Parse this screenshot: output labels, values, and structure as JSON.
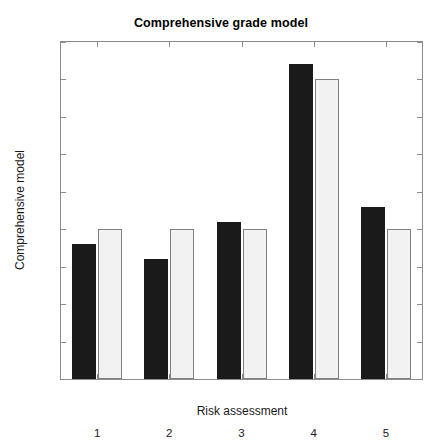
{
  "chart_data": {
    "type": "bar",
    "title": "Comprehensive grade model",
    "xlabel": "Risk assessment",
    "ylabel": "Comprehensive model",
    "categories": [
      "1",
      "2",
      "3",
      "4",
      "5"
    ],
    "series": [
      {
        "name": "series-dark",
        "color": "#1a1a1a",
        "values": [
          1.8,
          1.6,
          2.1,
          4.2,
          2.3
        ]
      },
      {
        "name": "series-light",
        "color": "#f2f2f2",
        "values": [
          2.0,
          2.0,
          2.0,
          4.0,
          2.0
        ]
      }
    ],
    "ylim": [
      0,
      4.5
    ],
    "yticks": [
      "0",
      "0.5",
      "1",
      "1.5",
      "2",
      "2.5",
      "3",
      "3.5",
      "4",
      "4.5"
    ],
    "ytick_values": [
      0,
      0.5,
      1,
      1.5,
      2,
      2.5,
      3,
      3.5,
      4,
      4.5
    ],
    "grid": false,
    "legend": "none",
    "axis_color": "#8c8c8c",
    "background": "#ffffff"
  }
}
